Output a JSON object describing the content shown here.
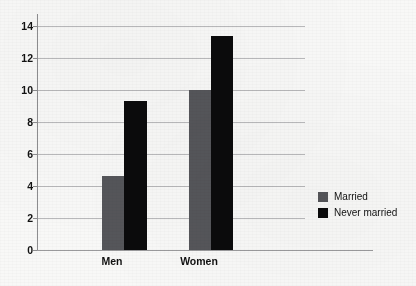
{
  "chart_data": {
    "type": "bar",
    "title": "",
    "subtitle": "",
    "xlabel": "",
    "ylabel": "",
    "categories": [
      "Men",
      "Women"
    ],
    "series": [
      {
        "name": "Married",
        "values": [
          4.6,
          10.0
        ],
        "color": "#55565a"
      },
      {
        "name": "Never married",
        "values": [
          9.3,
          13.4
        ],
        "color": "#0b0b0c"
      }
    ],
    "ylim": [
      0,
      14
    ],
    "ytick_labels": [
      "0",
      "2",
      "4",
      "6",
      "8",
      "10",
      "12",
      "14"
    ],
    "ytick_values": [
      0,
      2,
      4,
      6,
      8,
      10,
      12,
      14
    ],
    "grid": true,
    "legend_position": "right",
    "background_color": "#f8f8f7",
    "gridline_color": "#b9b9bb",
    "axis_color": "#8e8e90"
  },
  "legend": {
    "entries": [
      {
        "label": "Married",
        "color": "#55565a"
      },
      {
        "label": "Never married",
        "color": "#0b0b0c"
      }
    ]
  }
}
